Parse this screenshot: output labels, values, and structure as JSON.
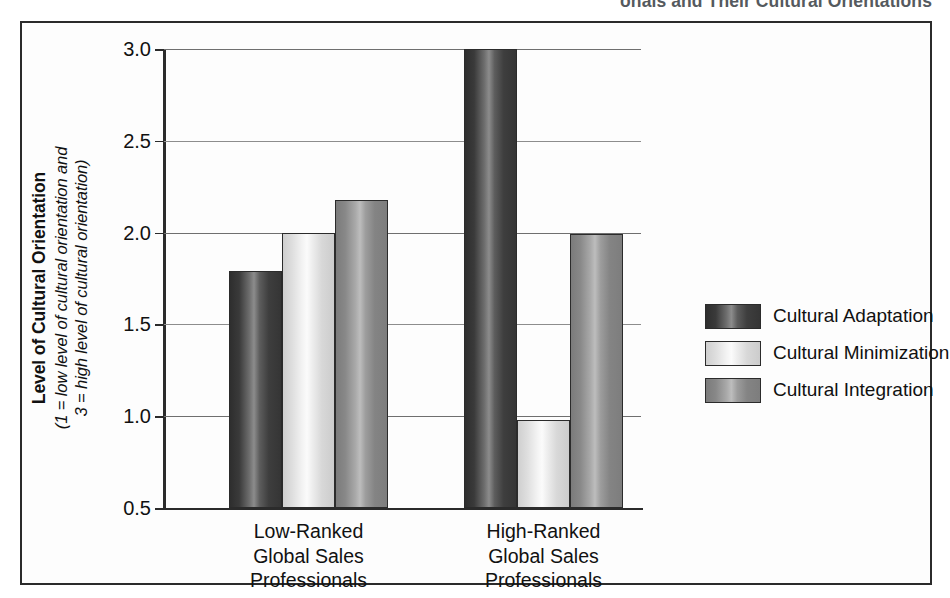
{
  "figure": {
    "caption_partial": "onals and Their Cultural Orientations"
  },
  "chart_data": {
    "type": "bar",
    "title": "",
    "categories": [
      "Low-Ranked\nGlobal Sales\nProfessionals",
      "High-Ranked\nGlobal Sales\nProfessionals"
    ],
    "series": [
      {
        "name": "Cultural Adaptation",
        "values": [
          1.79,
          3.0
        ],
        "color": "#3a3a3a"
      },
      {
        "name": "Cultural Minimization",
        "values": [
          2.0,
          0.98
        ],
        "color": "#e8e8e8"
      },
      {
        "name": "Cultural Integration",
        "values": [
          2.18,
          1.99
        ],
        "color": "#8a8a8a"
      }
    ],
    "xlabel": "",
    "ylabel_main": "Level of Cultural Orientation",
    "ylabel_sub_line1": "(1 = low level of cultural orientation and",
    "ylabel_sub_line2": "3 = high level of cultural orientation)",
    "ylim": [
      0.5,
      3.0
    ],
    "yticks": [
      0.5,
      1.0,
      1.5,
      2.0,
      2.5,
      3.0
    ],
    "ytick_labels": [
      "0.5",
      "1.0",
      "1.5",
      "2.0",
      "2.5",
      "3.0"
    ],
    "grid": true,
    "legend_position": "right"
  }
}
